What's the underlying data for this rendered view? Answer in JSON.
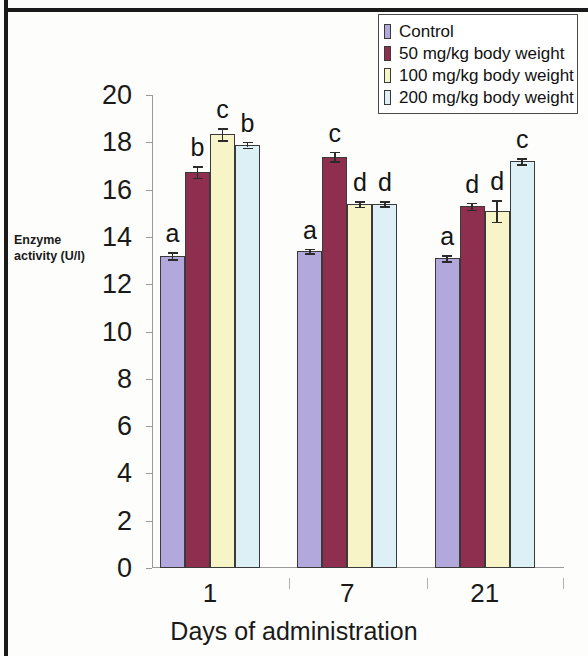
{
  "chart_data": {
    "type": "bar",
    "title": "",
    "xlabel": "Days of administration",
    "ylabel": "Enzyme activity (U/l)",
    "categories": [
      "1",
      "7",
      "21"
    ],
    "ylim": [
      0,
      20
    ],
    "ytick_step": 2,
    "yticks": [
      "0",
      "2",
      "4",
      "6",
      "8",
      "10",
      "12",
      "14",
      "16",
      "18",
      "20"
    ],
    "grid": false,
    "legend_position": "top-right",
    "series": [
      {
        "name": "Control",
        "color": "#b3a8dc",
        "values": [
          13.2,
          13.4,
          13.1
        ],
        "errors": [
          0.15,
          0.1,
          0.12
        ],
        "sig_labels": [
          "a",
          "a",
          "a"
        ]
      },
      {
        "name": "50 mg/kg body weight",
        "color": "#8e2f4f",
        "values": [
          16.75,
          17.4,
          15.3
        ],
        "errors": [
          0.25,
          0.2,
          0.15
        ],
        "sig_labels": [
          "b",
          "c",
          "d"
        ]
      },
      {
        "name": "100 mg/kg body weight",
        "color": "#f7f4c7",
        "values": [
          18.35,
          15.4,
          15.1
        ],
        "errors": [
          0.25,
          0.12,
          0.45
        ],
        "sig_labels": [
          "c",
          "d",
          "d"
        ]
      },
      {
        "name": "200 mg/kg body weight",
        "color": "#ddf0f5",
        "values": [
          17.9,
          15.4,
          17.2
        ],
        "errors": [
          0.12,
          0.1,
          0.12
        ],
        "sig_labels": [
          "b",
          "d",
          "c"
        ]
      }
    ]
  },
  "legend": {
    "items": [
      {
        "label": "Control",
        "color": "#b3a8dc"
      },
      {
        "label": "50 mg/kg body weight",
        "color": "#8e2f4f"
      },
      {
        "label": "100 mg/kg body weight",
        "color": "#f7f4c7"
      },
      {
        "label": "200 mg/kg body weight",
        "color": "#ddf0f5"
      }
    ]
  },
  "axes": {
    "y_title_line1": "Enzyme",
    "y_title_line2": "activity (U/l)",
    "x_title": "Days of administration"
  }
}
